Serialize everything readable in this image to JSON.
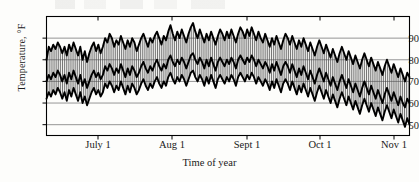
{
  "chart_data": {
    "type": "area",
    "title": "",
    "xlabel": "Time of year",
    "ylabel": "Temperature, °F",
    "ylim": [
      45,
      100
    ],
    "yticks": [
      50,
      60,
      70,
      80,
      90
    ],
    "xticks": [
      "July 1",
      "Aug 1",
      "Sept 1",
      "Oct 1",
      "Nov 1"
    ],
    "xtick_positions": [
      98,
      172,
      247,
      320,
      394
    ],
    "xlim_days": [
      0,
      162
    ],
    "grid": true,
    "legend": "none",
    "band_fill": "vertical-hatch",
    "colors": {
      "line": "#000000",
      "grid": "#8a8a8a",
      "hatch": "#4a4a4a",
      "frame": "#000000"
    },
    "series": [
      {
        "name": "Daily maximum",
        "values": [
          80,
          86,
          84,
          87,
          85,
          88,
          86,
          83,
          86,
          82,
          87,
          84,
          88,
          85,
          82,
          86,
          80,
          84,
          79,
          83,
          86,
          88,
          84,
          87,
          83,
          86,
          90,
          88,
          92,
          90,
          86,
          89,
          87,
          91,
          88,
          85,
          89,
          86,
          90,
          88,
          84,
          87,
          90,
          92,
          89,
          86,
          90,
          88,
          91,
          93,
          90,
          87,
          91,
          89,
          93,
          96,
          92,
          89,
          93,
          90,
          94,
          91,
          88,
          92,
          95,
          97,
          93,
          90,
          94,
          91,
          88,
          92,
          89,
          93,
          90,
          87,
          91,
          94,
          92,
          89,
          93,
          90,
          94,
          91,
          88,
          92,
          95,
          93,
          90,
          94,
          91,
          95,
          92,
          89,
          93,
          90,
          88,
          92,
          89,
          86,
          90,
          87,
          91,
          88,
          85,
          89,
          92,
          90,
          87,
          91,
          88,
          85,
          89,
          86,
          90,
          87,
          84,
          88,
          85,
          82,
          86,
          89,
          86,
          83,
          87,
          84,
          81,
          85,
          82,
          79,
          83,
          86,
          83,
          80,
          84,
          81,
          78,
          82,
          79,
          76,
          80,
          83,
          80,
          77,
          81,
          78,
          75,
          79,
          76,
          73,
          77,
          80,
          77,
          74,
          78,
          75,
          72,
          76,
          73,
          70,
          74,
          72
        ]
      },
      {
        "name": "Daily mean",
        "values": [
          70,
          73,
          71,
          74,
          72,
          75,
          73,
          70,
          73,
          69,
          74,
          71,
          75,
          72,
          69,
          73,
          68,
          71,
          67,
          70,
          73,
          75,
          72,
          74,
          71,
          73,
          77,
          75,
          78,
          76,
          73,
          76,
          74,
          78,
          75,
          72,
          76,
          73,
          77,
          75,
          72,
          74,
          77,
          79,
          76,
          74,
          77,
          75,
          78,
          80,
          77,
          75,
          78,
          76,
          80,
          82,
          79,
          77,
          80,
          78,
          81,
          79,
          76,
          79,
          82,
          83,
          80,
          78,
          81,
          79,
          76,
          80,
          77,
          81,
          78,
          75,
          79,
          81,
          79,
          77,
          80,
          78,
          81,
          79,
          76,
          80,
          82,
          80,
          78,
          81,
          79,
          82,
          80,
          77,
          80,
          78,
          76,
          79,
          77,
          74,
          78,
          75,
          79,
          76,
          73,
          77,
          79,
          77,
          74,
          78,
          75,
          72,
          76,
          73,
          77,
          74,
          71,
          75,
          72,
          69,
          73,
          76,
          73,
          70,
          74,
          71,
          68,
          72,
          69,
          66,
          70,
          73,
          70,
          67,
          71,
          68,
          65,
          69,
          66,
          63,
          67,
          70,
          67,
          64,
          68,
          65,
          62,
          66,
          63,
          60,
          64,
          67,
          64,
          61,
          65,
          62,
          59,
          63,
          60,
          58,
          62,
          60
        ]
      },
      {
        "name": "Daily minimum",
        "values": [
          62,
          65,
          63,
          66,
          64,
          67,
          65,
          62,
          65,
          61,
          66,
          63,
          67,
          64,
          61,
          65,
          60,
          63,
          59,
          62,
          65,
          67,
          64,
          66,
          63,
          65,
          69,
          67,
          70,
          68,
          65,
          68,
          66,
          70,
          67,
          64,
          68,
          65,
          69,
          67,
          64,
          66,
          69,
          71,
          68,
          66,
          69,
          67,
          70,
          72,
          69,
          67,
          70,
          68,
          72,
          74,
          71,
          69,
          72,
          70,
          73,
          71,
          68,
          71,
          74,
          75,
          72,
          70,
          73,
          71,
          68,
          72,
          69,
          73,
          70,
          67,
          71,
          73,
          71,
          69,
          72,
          70,
          73,
          71,
          68,
          72,
          74,
          72,
          70,
          73,
          71,
          74,
          72,
          69,
          72,
          70,
          68,
          71,
          69,
          66,
          70,
          67,
          71,
          68,
          65,
          69,
          71,
          69,
          66,
          70,
          67,
          64,
          68,
          65,
          69,
          66,
          63,
          67,
          64,
          61,
          65,
          68,
          65,
          62,
          66,
          63,
          60,
          64,
          61,
          58,
          62,
          65,
          62,
          59,
          63,
          60,
          57,
          61,
          58,
          55,
          59,
          62,
          59,
          56,
          60,
          57,
          54,
          58,
          55,
          52,
          56,
          59,
          56,
          53,
          57,
          54,
          51,
          55,
          52,
          49,
          53,
          50
        ]
      }
    ]
  }
}
